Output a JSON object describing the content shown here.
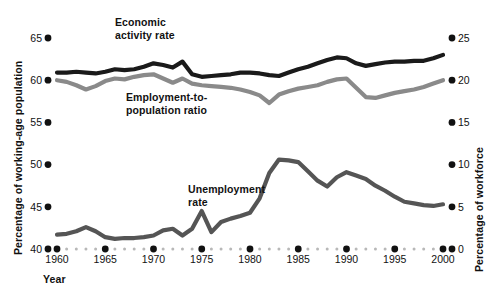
{
  "chart_data": {
    "type": "line",
    "title": "",
    "xlabel": "Year",
    "ylabel": "Percentage of working-age population",
    "y2label": "Percentage of workforce",
    "xlim": [
      1960,
      2000
    ],
    "ylim": [
      40,
      65
    ],
    "y2lim": [
      0,
      25
    ],
    "grid": false,
    "legend_position": "inline-annotations",
    "xticks": [
      1960,
      1965,
      1970,
      1975,
      1980,
      1985,
      1990,
      1995,
      2000
    ],
    "xticklabels": [
      "1960",
      "1965",
      "1970",
      "1975",
      "1980",
      "1985",
      "1990",
      "1995",
      "2000"
    ],
    "yticks": [
      40,
      45,
      50,
      55,
      60,
      65
    ],
    "yticklabels": [
      "40",
      "45",
      "50",
      "55",
      "60",
      "65"
    ],
    "y2ticks": [
      0,
      5,
      10,
      15,
      20,
      25
    ],
    "y2ticklabels": [
      "0",
      "5",
      "10",
      "15",
      "20",
      "25"
    ],
    "x": [
      1960,
      1961,
      1962,
      1963,
      1964,
      1965,
      1966,
      1967,
      1968,
      1969,
      1970,
      1971,
      1972,
      1973,
      1974,
      1975,
      1976,
      1977,
      1978,
      1979,
      1980,
      1981,
      1982,
      1983,
      1984,
      1985,
      1986,
      1987,
      1988,
      1989,
      1990,
      1991,
      1992,
      1993,
      1994,
      1995,
      1996,
      1997,
      1998,
      1999,
      2000
    ],
    "series": [
      {
        "name": "Economic activity rate",
        "axis": "left",
        "color": "#1a1a1a",
        "values": [
          60.9,
          60.9,
          61.0,
          60.9,
          60.8,
          61.0,
          61.3,
          61.2,
          61.3,
          61.6,
          62.0,
          61.8,
          61.5,
          62.2,
          60.7,
          60.4,
          60.5,
          60.6,
          60.7,
          60.9,
          60.9,
          60.8,
          60.6,
          60.5,
          60.9,
          61.3,
          61.6,
          62.0,
          62.4,
          62.7,
          62.6,
          62.0,
          61.7,
          61.9,
          62.1,
          62.2,
          62.2,
          62.3,
          62.3,
          62.6,
          63.0
        ]
      },
      {
        "name": "Employment-to-population ratio",
        "axis": "left",
        "color": "#8a8a8a",
        "values": [
          60.0,
          59.8,
          59.4,
          58.9,
          59.3,
          59.9,
          60.2,
          60.1,
          60.4,
          60.6,
          60.7,
          60.2,
          59.7,
          60.2,
          59.6,
          59.4,
          59.3,
          59.2,
          59.1,
          58.9,
          58.6,
          58.2,
          57.3,
          58.3,
          58.7,
          59.0,
          59.2,
          59.4,
          59.8,
          60.1,
          60.2,
          59.1,
          58.0,
          57.9,
          58.2,
          58.5,
          58.7,
          58.9,
          59.2,
          59.6,
          60.0
        ]
      },
      {
        "name": "Unemployment rate",
        "axis": "right",
        "color": "#555555",
        "values": [
          1.7,
          1.8,
          2.1,
          2.6,
          2.1,
          1.4,
          1.2,
          1.3,
          1.3,
          1.4,
          1.6,
          2.2,
          2.4,
          1.6,
          2.4,
          4.5,
          2.0,
          3.2,
          3.6,
          3.9,
          4.3,
          6.0,
          9.0,
          10.6,
          10.5,
          10.3,
          9.2,
          8.1,
          7.4,
          8.5,
          9.1,
          8.7,
          8.3,
          7.5,
          6.9,
          6.2,
          5.6,
          5.4,
          5.2,
          5.1,
          5.3
        ]
      }
    ],
    "annotations": [
      {
        "text": "Economic\nactivity rate",
        "x_px": 115,
        "y_px": 17
      },
      {
        "text": "Employment-to-\npopulation ratio",
        "x_px": 126,
        "y_px": 92
      },
      {
        "text": "Unemployment\nrate",
        "x_px": 188,
        "y_px": 184
      }
    ]
  },
  "labels": {
    "y_axis_title": "Percentage of working-age population",
    "y2_axis_title": "Percentage of workforce",
    "x_axis_title": "Year",
    "series1_line1": "Economic",
    "series1_line2": "activity rate",
    "series2_line1": "Employment-to-",
    "series2_line2": "population ratio",
    "series3_line1": "Unemployment",
    "series3_line2": "rate"
  },
  "colors": {
    "economic_activity": "#1a1a1a",
    "employment_ratio": "#8a8a8a",
    "unemployment": "#555555",
    "axis_dot_major": "#111111",
    "axis_dot_minor": "#b8b8b8",
    "background": "#ffffff"
  }
}
